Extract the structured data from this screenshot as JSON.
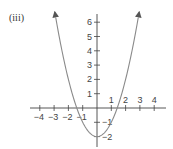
{
  "panel_label": "(iii)",
  "colors": {
    "axis": "#444444",
    "curve": "#8a8a8a",
    "text": "#444444",
    "background": "#ffffff"
  },
  "chart_data": {
    "type": "line",
    "title": "",
    "panel": "(iii)",
    "equation": "y = x^2 - 2",
    "xlabel": "",
    "ylabel": "",
    "xlim": [
      -4.5,
      5
    ],
    "ylim": [
      -2.7,
      6.5
    ],
    "x_ticks": [
      -4,
      -3,
      -2,
      -1,
      1,
      2,
      3,
      4
    ],
    "y_ticks": [
      -2,
      -1,
      1,
      2,
      3,
      4,
      5,
      6
    ],
    "x_tick_labels": [
      "-4",
      "-3",
      "-2",
      "-1",
      "1",
      "2",
      "3",
      "4"
    ],
    "y_tick_labels": [
      "-2",
      "-1",
      "1",
      "2",
      "3",
      "4",
      "5",
      "6"
    ],
    "grid": false,
    "legend": null,
    "arrows_on_curve_ends": true,
    "series": [
      {
        "name": "parabola",
        "x": [
          -2.9,
          -2.5,
          -2,
          -1.5,
          -1,
          -0.5,
          0,
          0.5,
          1,
          1.5,
          2,
          2.5,
          2.9
        ],
        "y": [
          6.41,
          4.25,
          2,
          0.25,
          -1,
          -1.75,
          -2,
          -1.75,
          -1,
          0.25,
          2,
          4.25,
          6.41
        ]
      }
    ],
    "key_points": {
      "vertex": [
        0,
        -2
      ],
      "x_intercepts": [
        -1.414,
        1.414
      ],
      "y_intercept": -2
    }
  }
}
